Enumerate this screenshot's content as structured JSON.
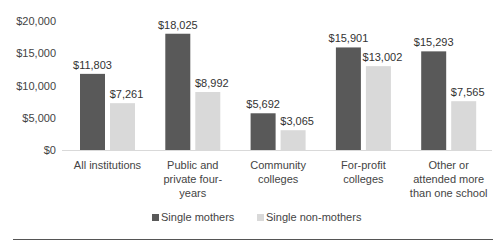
{
  "chart_data": {
    "type": "bar",
    "title": "",
    "xlabel": "",
    "ylabel": "",
    "ylim": [
      0,
      20000
    ],
    "yticks": [
      "$0",
      "$5,000",
      "$10,000",
      "$15,000",
      "$20,000"
    ],
    "ytick_values": [
      0,
      5000,
      10000,
      15000,
      20000
    ],
    "categories": [
      [
        "All institutions"
      ],
      [
        "Public and",
        "private four-",
        "years"
      ],
      [
        "Community",
        "colleges"
      ],
      [
        "For-profit",
        "colleges"
      ],
      [
        "Other or",
        "attended more",
        "than one school"
      ]
    ],
    "series": [
      {
        "name": "Single mothers",
        "color": "#595959",
        "values": [
          11803,
          18025,
          5692,
          15901,
          15293
        ],
        "labels": [
          "$11,803",
          "$18,025",
          "$5,692",
          "$15,901",
          "$15,293"
        ]
      },
      {
        "name": "Single non-mothers",
        "color": "#d9d9d9",
        "values": [
          7261,
          8992,
          3065,
          13002,
          7565
        ],
        "labels": [
          "$7,261",
          "$8,992",
          "$3,065",
          "$13,002",
          "$7,565"
        ]
      }
    ],
    "legend": "bottom",
    "grid": false
  }
}
